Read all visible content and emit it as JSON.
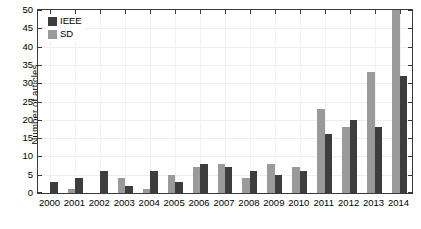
{
  "chart_data": {
    "type": "bar",
    "title": "",
    "subtitle": "",
    "xlabel": "",
    "ylabel": "Number of articles",
    "categories": [
      "2000",
      "2001",
      "2002",
      "2003",
      "2004",
      "2005",
      "2006",
      "2007",
      "2008",
      "2009",
      "2010",
      "2011",
      "2012",
      "2013",
      "2014"
    ],
    "series": [
      {
        "name": "IEEE",
        "color": "#3d3d3d",
        "values": [
          3,
          4,
          6,
          2,
          6,
          3,
          8,
          7,
          6,
          5,
          6,
          16,
          20,
          18,
          32
        ]
      },
      {
        "name": "SD",
        "color": "#9a9a9a",
        "values": [
          0,
          1,
          0,
          4,
          1,
          5,
          7,
          8,
          4,
          8,
          7,
          23,
          18,
          33,
          50
        ]
      }
    ],
    "series_draw_order": [
      "SD",
      "IEEE"
    ],
    "ylim": [
      0,
      50
    ],
    "yticks": [
      0,
      5,
      10,
      15,
      20,
      25,
      30,
      35,
      40,
      45,
      50
    ],
    "ytick_labels": [
      "0",
      "5",
      "10",
      "15",
      "20",
      "25",
      "30",
      "35",
      "40",
      "45",
      "50"
    ],
    "xtick_labels": [
      "2000",
      "2001",
      "2002",
      "2003",
      "2004",
      "2005",
      "2006",
      "2007",
      "2008",
      "2009",
      "2010",
      "2011",
      "2012",
      "2013",
      "2014"
    ],
    "grid": true,
    "grid_axis": "both",
    "legend_position": "top-left",
    "legend_entries": [
      {
        "label": "IEEE",
        "color": "#3d3d3d"
      },
      {
        "label": "SD",
        "color": "#9a9a9a"
      }
    ],
    "axis_color": "#3a3a3a",
    "background_color": "#ffffff"
  }
}
